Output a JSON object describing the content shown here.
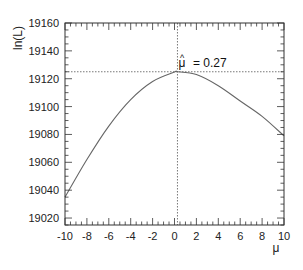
{
  "chart_data": {
    "type": "line",
    "title": "",
    "xlabel": "μ",
    "ylabel": "ln(L)",
    "xlim": [
      -10,
      10
    ],
    "ylim": [
      19015,
      19160
    ],
    "grid": false,
    "legend": null,
    "x_ticks": [
      -10,
      -8,
      -6,
      -4,
      -2,
      0,
      2,
      4,
      6,
      8,
      10
    ],
    "x_tick_labels": [
      "-10",
      "-8",
      "-6",
      "-4",
      "-2",
      "0",
      "2",
      "4",
      "6",
      "8",
      "10"
    ],
    "y_ticks": [
      19020,
      19040,
      19060,
      19080,
      19100,
      19120,
      19140,
      19160
    ],
    "y_tick_labels": [
      "19020",
      "19040",
      "19060",
      "19080",
      "19100",
      "19120",
      "19140",
      "19160"
    ],
    "series": [
      {
        "name": "ln(L)",
        "x": [
          -10,
          -8,
          -6,
          -4,
          -2,
          0,
          0.27,
          2,
          4,
          6,
          8,
          10
        ],
        "values": [
          19035,
          19062,
          19086,
          19105,
          19118,
          19124.8,
          19125,
          19123,
          19115,
          19104,
          19093,
          19079
        ],
        "color": "#666666"
      }
    ],
    "annotations": [
      {
        "text": "μ̂ = 0.27",
        "x": 0.27,
        "y": 19125,
        "type": "max-likelihood marker"
      }
    ],
    "reference_lines": [
      {
        "orientation": "vertical",
        "value": 0.27,
        "style": "dotted"
      },
      {
        "orientation": "horizontal",
        "value": 19125,
        "style": "dotted"
      }
    ]
  },
  "labels": {
    "ylabel": "ln(L)",
    "xlabel": "μ",
    "annotation_hat": "^",
    "annotation_mu": "μ",
    "annotation_value": "= 0.27"
  }
}
